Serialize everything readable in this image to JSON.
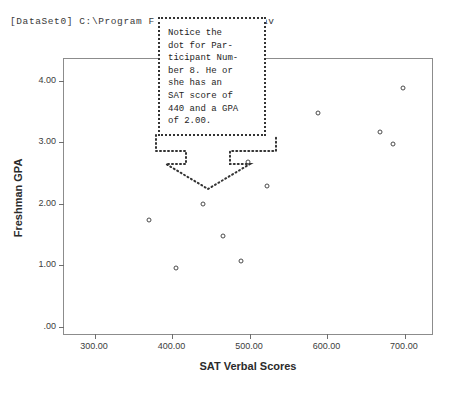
{
  "header": {
    "dataset_line": "[DataSet0] C:\\Program F              A.sav"
  },
  "annotation": {
    "text": "Notice the\ndot for Par-\nticipant Num-\nber 8. He or\nshe has an\nSAT score of\n440 and a GPA\nof 2.00.",
    "arrow_direction": "down",
    "points_to": "participant-8-point"
  },
  "caption": {
    "text": ""
  },
  "chart_data": {
    "type": "scatter",
    "title": "",
    "xlabel": "SAT Verbal Scores",
    "ylabel": "Freshman GPA",
    "xlim": [
      260,
      735
    ],
    "ylim": [
      -0.12,
      4.35
    ],
    "xticks": [
      300,
      400,
      500,
      600,
      700
    ],
    "xtick_labels": [
      "300.00",
      "400.00",
      "500.00",
      "600.00",
      "700.00"
    ],
    "yticks": [
      0,
      1,
      2,
      3,
      4
    ],
    "ytick_labels": [
      ".00",
      "1.00",
      "2.00",
      "3.00",
      "4.00"
    ],
    "grid": false,
    "legend": false,
    "marker": "open-circle",
    "series": [
      {
        "name": "Participants",
        "points": [
          {
            "x": 370,
            "y": 1.73
          },
          {
            "x": 405,
            "y": 0.95
          },
          {
            "x": 440,
            "y": 2.0
          },
          {
            "x": 465,
            "y": 1.48
          },
          {
            "x": 488,
            "y": 1.07
          },
          {
            "x": 497,
            "y": 2.67
          },
          {
            "x": 522,
            "y": 2.28
          },
          {
            "x": 588,
            "y": 3.47
          },
          {
            "x": 668,
            "y": 3.17
          },
          {
            "x": 685,
            "y": 2.97
          },
          {
            "x": 698,
            "y": 3.88
          }
        ]
      }
    ]
  }
}
